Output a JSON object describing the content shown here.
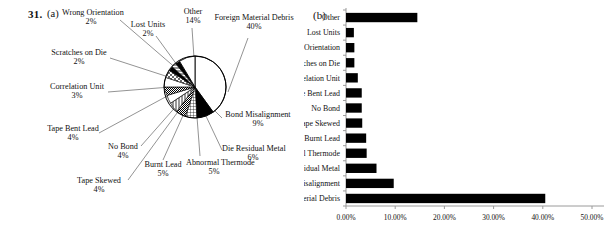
{
  "figure": {
    "number": "31.",
    "panel_a_label": "(a)",
    "panel_b_label": "(b)"
  },
  "chart_data": [
    {
      "type": "pie",
      "title": "",
      "id": "panel-a-pie",
      "legend": "leader-line labels",
      "unit": "%",
      "categories": [
        "Foreign Material Debris",
        "Bond Misalignment",
        "Die Residual Metal",
        "Abnormal Thermode",
        "Burnt Lead",
        "Tape Skewed",
        "No Bond",
        "Tape Bent Lead",
        "Correlation Unit",
        "Scratches on Die",
        "Wrong Orientation",
        "Lost Units",
        "Other"
      ],
      "values": [
        40,
        9,
        6,
        5,
        5,
        4,
        4,
        4,
        3,
        2,
        2,
        2,
        14
      ],
      "labels": [
        {
          "name": "Foreign Material Debris",
          "pct": "40%"
        },
        {
          "name": "Bond Misalignment",
          "pct": "9%"
        },
        {
          "name": "Die Residual Metal",
          "pct": "6%"
        },
        {
          "name": "Abnormal Thermode",
          "pct": "5%"
        },
        {
          "name": "Burnt Lead",
          "pct": "5%"
        },
        {
          "name": "Tape Skewed",
          "pct": "4%"
        },
        {
          "name": "No Bond",
          "pct": "4%"
        },
        {
          "name": "Tape Bent Lead",
          "pct": "4%"
        },
        {
          "name": "Correlation Unit",
          "pct": "3%"
        },
        {
          "name": "Scratches on Die",
          "pct": "2%"
        },
        {
          "name": "Wrong Orientation",
          "pct": "2%"
        },
        {
          "name": "Lost Units",
          "pct": "2%"
        },
        {
          "name": "Other",
          "pct": "14%"
        }
      ]
    },
    {
      "type": "bar",
      "orientation": "horizontal",
      "id": "panel-b-bar",
      "title": "",
      "xlabel": "",
      "ylabel": "",
      "xlim": [
        0,
        50
      ],
      "grid": false,
      "legend": "none",
      "categories": [
        "Other",
        "Lost Units",
        "Wrong Orientation",
        "Scratches on Die",
        "Correlation Unit",
        "Tape Bent Lead",
        "No Bond",
        "Tape Skewed",
        "Burnt Lead",
        "Abnormal Thermode",
        "Die Residual Metal",
        "Bond Misalignment",
        "Foreign Material Debris"
      ],
      "values": [
        14.5,
        1.6,
        1.7,
        1.7,
        2.4,
        3.2,
        3.2,
        3.3,
        4.1,
        4.2,
        6.2,
        9.7,
        40.5
      ],
      "tick_labels": [
        "0.00%",
        "10.00%",
        "20.00%",
        "30.00%",
        "40.00%",
        "50.00%"
      ],
      "tick_values": [
        0,
        10,
        20,
        30,
        40,
        50
      ]
    }
  ],
  "pie_label_positions": [
    {
      "key": "wrong-orientation",
      "left": 62,
      "top": 8,
      "w": 58
    },
    {
      "key": "lost-units",
      "left": 126,
      "top": 18,
      "w": 44
    },
    {
      "key": "other",
      "left": 176,
      "top": 8,
      "w": 34
    },
    {
      "key": "foreign-material",
      "left": 214,
      "top": 16,
      "w": 78
    },
    {
      "key": "scratches-on-die",
      "left": 50,
      "top": 48,
      "w": 58
    },
    {
      "key": "correlation-unit",
      "left": 48,
      "top": 82,
      "w": 58
    },
    {
      "key": "bond-misalignment",
      "left": 222,
      "top": 112,
      "w": 70
    },
    {
      "key": "tape-bent-lead",
      "left": 48,
      "top": 124,
      "w": 50
    },
    {
      "key": "no-bond",
      "left": 104,
      "top": 142,
      "w": 40
    },
    {
      "key": "die-residual-metal",
      "left": 222,
      "top": 146,
      "w": 60
    },
    {
      "key": "burnt-lead",
      "left": 140,
      "top": 160,
      "w": 46
    },
    {
      "key": "abnormal-thermode",
      "left": 186,
      "top": 158,
      "w": 54
    },
    {
      "key": "tape-skewed",
      "left": 72,
      "top": 176,
      "w": 56
    }
  ]
}
